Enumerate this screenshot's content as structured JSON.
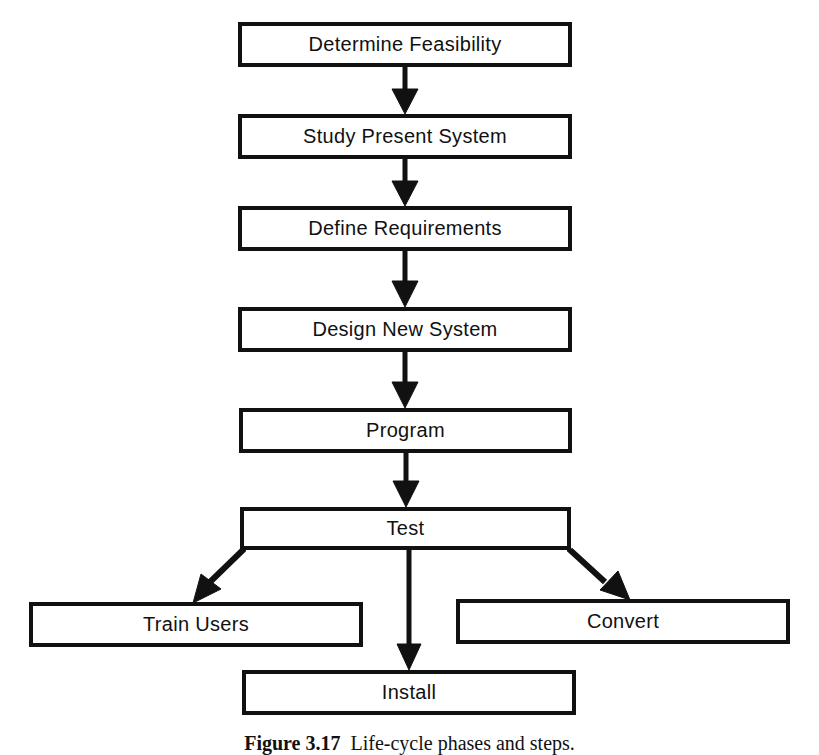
{
  "diagram": {
    "type": "flowchart",
    "nodes": [
      {
        "id": "feasibility",
        "label": "Determine Feasibility",
        "x": 238,
        "y": 22,
        "w": 334,
        "h": 45
      },
      {
        "id": "study",
        "label": "Study Present System",
        "x": 238,
        "y": 114,
        "w": 334,
        "h": 45
      },
      {
        "id": "requirements",
        "label": "Define Requirements",
        "x": 238,
        "y": 206,
        "w": 334,
        "h": 45
      },
      {
        "id": "design",
        "label": "Design New System",
        "x": 238,
        "y": 307,
        "w": 334,
        "h": 45
      },
      {
        "id": "program",
        "label": "Program",
        "x": 239,
        "y": 408,
        "w": 333,
        "h": 45
      },
      {
        "id": "test",
        "label": "Test",
        "x": 240,
        "y": 507,
        "w": 331,
        "h": 43
      },
      {
        "id": "train",
        "label": "Train Users",
        "x": 29,
        "y": 602,
        "w": 334,
        "h": 45
      },
      {
        "id": "convert",
        "label": "Convert",
        "x": 456,
        "y": 599,
        "w": 334,
        "h": 45
      },
      {
        "id": "install",
        "label": "Install",
        "x": 242,
        "y": 670,
        "w": 334,
        "h": 45
      }
    ],
    "edges": [
      {
        "from": "feasibility",
        "to": "study"
      },
      {
        "from": "study",
        "to": "requirements"
      },
      {
        "from": "requirements",
        "to": "design"
      },
      {
        "from": "design",
        "to": "program"
      },
      {
        "from": "program",
        "to": "test"
      },
      {
        "from": "test",
        "to": "train"
      },
      {
        "from": "test",
        "to": "install"
      },
      {
        "from": "test",
        "to": "convert"
      }
    ],
    "colors": {
      "stroke": "#111111",
      "background": "#ffffff"
    }
  },
  "caption": {
    "figure_number": "Figure 3.17",
    "text": "Life-cycle phases and steps."
  }
}
